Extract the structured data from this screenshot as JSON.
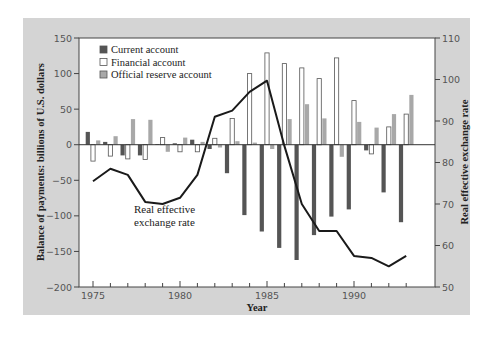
{
  "chart_data": {
    "type": "bar+line",
    "title": "",
    "xlabel": "Year",
    "ylabel": "Balance of payments: billions of U.S. dollars",
    "y2label": "Real effective exchange rate",
    "ylim": [
      -200,
      150
    ],
    "y2lim": [
      50,
      110
    ],
    "yticks": [
      150,
      100,
      50,
      0,
      -50,
      -100,
      -150,
      -200
    ],
    "y2ticks": [
      110,
      100,
      90,
      80,
      70,
      60,
      50
    ],
    "xticks_labeled": [
      1975,
      1980,
      1985,
      1990
    ],
    "categories": [
      1975,
      1976,
      1977,
      1978,
      1979,
      1980,
      1981,
      1982,
      1983,
      1984,
      1985,
      1986,
      1987,
      1988,
      1989,
      1990,
      1991,
      1992,
      1993
    ],
    "legend": [
      {
        "label": "Current account",
        "color": "#555555"
      },
      {
        "label": "Financial account",
        "color": "#ffffff"
      },
      {
        "label": "Official reserve account",
        "color": "#a8a8a8"
      }
    ],
    "legend_position": "upper left",
    "grid": false,
    "series": [
      {
        "name": "Current account",
        "axis": "left",
        "type": "bar",
        "values": [
          18,
          4,
          -15,
          -15,
          1,
          2,
          7,
          -6,
          -40,
          -99,
          -122,
          -145,
          -162,
          -127,
          -101,
          -91,
          -8,
          -67,
          -109
        ]
      },
      {
        "name": "Financial account",
        "axis": "left",
        "type": "bar",
        "values": [
          -23,
          -16,
          -20,
          -21,
          10,
          -10,
          -10,
          9,
          37,
          100,
          129,
          114,
          108,
          93,
          122,
          62,
          -13,
          25,
          43
        ]
      },
      {
        "name": "Official reserve account",
        "axis": "left",
        "type": "bar",
        "values": [
          6,
          12,
          36,
          35,
          -10,
          10,
          4,
          -4,
          5,
          3,
          -6,
          36,
          57,
          37,
          -17,
          32,
          24,
          43,
          70
        ]
      },
      {
        "name": "Real effective exchange rate",
        "axis": "right",
        "type": "line",
        "values": [
          75.5,
          78.5,
          77,
          70.5,
          70,
          71.5,
          77,
          91,
          92.5,
          97,
          99.7,
          84,
          70,
          63.5,
          63.5,
          57.5,
          57,
          55,
          57.5
        ]
      }
    ],
    "annotations": [
      {
        "text": "Real effective exchange rate",
        "lines": [
          "Real effective",
          "exchange rate"
        ],
        "x": 1978.5,
        "y": -95
      }
    ]
  }
}
